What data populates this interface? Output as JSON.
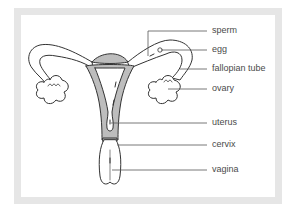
{
  "diagram": {
    "type": "labeled anatomical diagram",
    "colors": {
      "frame": "#e6e6e6",
      "outline": "#333333",
      "wall_fill": "#bdbdbd",
      "label_text": "#4a4a4a",
      "leader_line": "#555555"
    },
    "labels": [
      {
        "id": "sperm",
        "text": "sperm"
      },
      {
        "id": "egg",
        "text": "egg"
      },
      {
        "id": "fallopian_tube",
        "text": "fallopian tube"
      },
      {
        "id": "ovary",
        "text": "ovary"
      },
      {
        "id": "uterus",
        "text": "uterus"
      },
      {
        "id": "cervix",
        "text": "cervix"
      },
      {
        "id": "vagina",
        "text": "vagina"
      }
    ]
  }
}
